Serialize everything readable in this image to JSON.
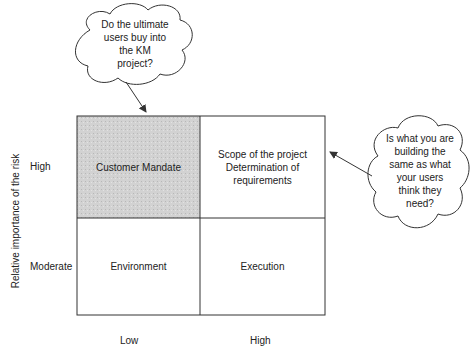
{
  "diagram": {
    "y_axis_title": "Relative importance of the risk",
    "y_labels": [
      "High",
      "Moderate"
    ],
    "x_labels": [
      "Low",
      "High"
    ],
    "cells": [
      {
        "id": "customer-mandate",
        "text": "Customer Mandate",
        "shaded": true
      },
      {
        "id": "scope",
        "lines": [
          "Scope of the project",
          "Determination of",
          "requirements"
        ],
        "shaded": false
      },
      {
        "id": "environment",
        "text": "Environment",
        "shaded": false
      },
      {
        "id": "execution",
        "text": "Execution",
        "shaded": false
      }
    ],
    "callouts": [
      {
        "id": "top-cloud",
        "lines": [
          "Do the ultimate",
          "users buy into",
          "the KM",
          "project?"
        ],
        "points_to": "customer-mandate"
      },
      {
        "id": "right-cloud",
        "lines": [
          "Is what you are",
          "building the",
          "same as what",
          "your users",
          "think they",
          "need?"
        ],
        "points_to": "scope"
      }
    ],
    "colors": {
      "line": "#333333",
      "shade": "#cfcfcf"
    }
  }
}
